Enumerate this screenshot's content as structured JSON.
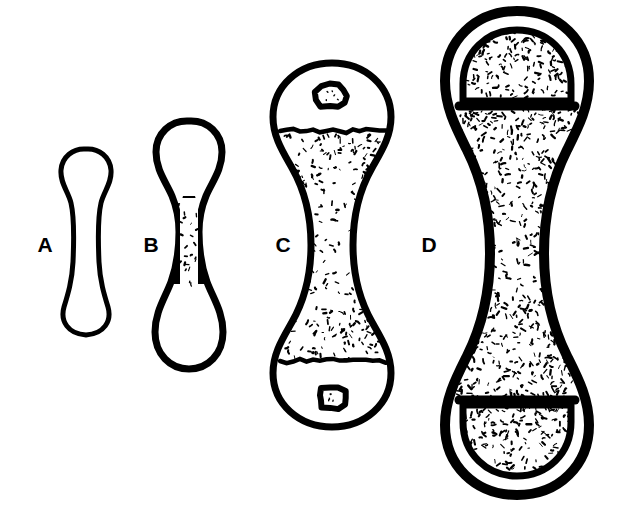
{
  "figure": {
    "type": "line-drawing",
    "background_color": "#ffffff",
    "ink_color": "#000000",
    "canvas": {
      "width": 622,
      "height": 510
    }
  },
  "specimens": [
    {
      "id": "A",
      "label": "A",
      "label_x": 45,
      "label_y": 246,
      "stage": "cartilage model, unossified",
      "bounds": {
        "x": 57,
        "y": 147,
        "width": 59,
        "height": 190
      },
      "cortex_stroke": 5,
      "interior": "empty",
      "has_trabeculae": false,
      "has_epiphysis": false,
      "has_ossification_nucleus": false,
      "outline": "M 86 149 C 99 148 110 157 111 170 C 112 183 104 191 101 203 C 98 216 98 240 99 262 C 100 281 104 294 108 307 C 112 321 104 334 86 335 C 68 334 60 321 64 307 C 68 294 72 281 73 262 C 74 240 74 216 71 203 C 68 191 60 183 61 170 C 62 157 73 148 86 149 Z"
    },
    {
      "id": "B",
      "label": "B",
      "label_x": 151,
      "label_y": 246,
      "stage": "primary ossification centre in diaphysis",
      "bounds": {
        "x": 153,
        "y": 118,
        "width": 72,
        "height": 254
      },
      "cortex_stroke": 7,
      "interior": "empty epiphyses, thick waist cortex with sparse trabeculae",
      "has_trabeculae": true,
      "has_epiphysis": false,
      "has_ossification_nucleus": false,
      "outline": "M 189 121 C 208 120 222 134 222 152 C 222 170 212 182 206 196 C 201 208 199 218 199 232 C 199 254 202 268 207 282 C 213 298 223 312 223 332 C 223 354 208 369 189 369 C 170 369 155 354 155 332 C 155 312 165 298 171 282 C 176 268 179 254 179 232 C 179 218 177 208 172 196 C 166 182 156 170 156 152 C 156 134 170 120 189 121 Z",
      "waist_fill": "M 183 196 L 195 196 C 199 210 201 220 201 232 C 201 256 204 270 208 284 L 170 284 C 174 270 177 256 177 232 C 177 220 179 210 183 196 Z",
      "trabecular_box": {
        "x": 179,
        "y": 198,
        "width": 20,
        "height": 86,
        "density": 0.3
      }
    },
    {
      "id": "C",
      "label": "C",
      "label_x": 283,
      "label_y": 246,
      "stage": "secondary ossification centres appearing in epiphyses",
      "bounds": {
        "x": 267,
        "y": 60,
        "width": 130,
        "height": 371
      },
      "cortex_stroke": 7,
      "interior": "stippled metaphyses, clear epiphyses with small ossific nuclei",
      "has_trabeculae": true,
      "has_epiphysis": true,
      "has_ossification_nucleus": true,
      "outline": "M 332 63 C 365 63 391 86 391 117 C 391 137 381 152 372 168 C 360 189 353 212 353 245 C 353 278 360 301 372 322 C 381 338 391 353 391 373 C 391 404 365 427 332 427 C 299 427 273 404 273 373 C 273 353 283 338 292 322 C 304 301 311 278 311 245 C 311 212 304 189 292 168 C 283 152 273 137 273 117 C 273 86 299 63 332 63 Z",
      "plate_top_y": 131,
      "plate_bottom_y": 361,
      "nucleus_top": {
        "cx": 332,
        "cy": 96,
        "rx": 15,
        "ry": 12
      },
      "nucleus_bottom": {
        "cx": 332,
        "cy": 398,
        "rx": 14,
        "ry": 11
      },
      "trabecular_density": 0.35
    },
    {
      "id": "D",
      "label": "D",
      "label_x": 429,
      "label_y": 246,
      "stage": "fully formed epiphyses, epiphyseal plates fusing",
      "bounds": {
        "x": 441,
        "y": 8,
        "width": 151,
        "height": 490
      },
      "cortex_stroke": 10,
      "interior": "fully trabeculated epiphyses and metaphyses, clear medullary cavity",
      "has_trabeculae": true,
      "has_epiphysis": true,
      "has_ossification_nucleus": false,
      "outline": "M 517 11 C 559 11 589 41 589 81 C 589 107 578 128 567 150 C 552 180 544 212 544 253 C 544 294 552 326 567 356 C 578 378 589 399 589 425 C 589 465 559 495 517 495 C 475 495 445 465 445 425 C 445 399 456 378 467 356 C 482 326 490 294 490 253 C 490 212 482 180 467 150 C 456 128 445 107 445 81 C 445 41 475 11 517 11 Z",
      "epiphysis_top_inner": "M 463 101 L 463 84 C 463 52 487 30 517 30 C 547 30 571 52 571 84 L 571 101 Z",
      "epiphysis_bottom_inner": "M 463 405 L 571 405 L 571 422 C 571 454 547 476 517 476 C 487 476 463 454 463 422 Z",
      "plate_top_y": 106,
      "plate_bottom_y": 400,
      "trabecular_density": 0.42
    }
  ]
}
